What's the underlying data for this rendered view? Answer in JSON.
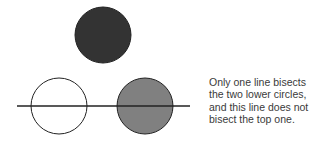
{
  "diagram": {
    "circles": [
      {
        "name": "top",
        "cx": 103,
        "cy": 35,
        "r": 28,
        "fill": "#333333",
        "stroke": "#222222"
      },
      {
        "name": "bottom-left",
        "cx": 59,
        "cy": 106,
        "r": 28,
        "fill": "#ffffff",
        "stroke": "#222222"
      },
      {
        "name": "bottom-right",
        "cx": 145,
        "cy": 106,
        "r": 28,
        "fill": "#808080",
        "stroke": "#222222"
      }
    ],
    "line": {
      "x1": 17,
      "y1": 106,
      "x2": 190,
      "y2": 106,
      "stroke": "#222222"
    }
  },
  "caption": {
    "lines": [
      "Only one line bisects",
      "the two lower circles,",
      "and this line does not",
      "bisect the top one."
    ]
  }
}
